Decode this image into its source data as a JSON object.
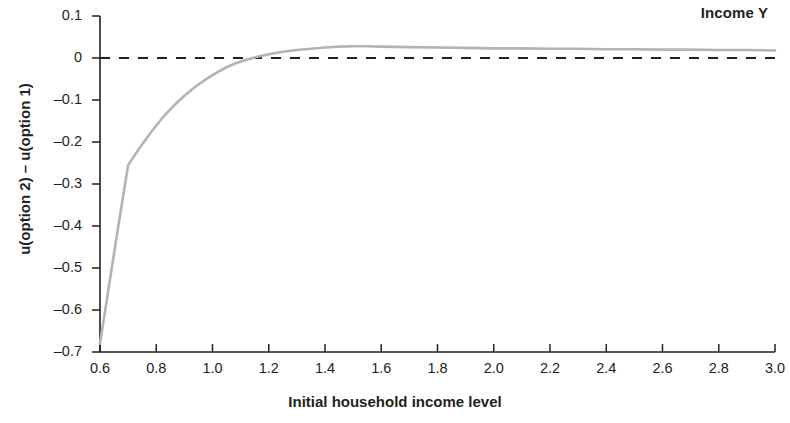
{
  "chart_data": {
    "type": "line",
    "title": "",
    "annotation": "Income Y",
    "xlabel": "Initial household income level",
    "ylabel": "u(option 2) – u(option 1)",
    "xlim": [
      0.6,
      3.0
    ],
    "ylim": [
      -0.7,
      0.1
    ],
    "xticks": [
      "0.6",
      "0.8",
      "1.0",
      "1.2",
      "1.4",
      "1.6",
      "1.8",
      "2.0",
      "2.2",
      "2.4",
      "2.6",
      "2.8",
      "3.0"
    ],
    "yticks": [
      "0.1",
      "0",
      "–0.1",
      "–0.2",
      "–0.3",
      "–0.4",
      "–0.5",
      "–0.6",
      "–0.7"
    ],
    "grid": false,
    "legend": "none",
    "reference_line": {
      "orientation": "horizontal",
      "value": 0,
      "style": "dashed",
      "color": "#231f20"
    },
    "series": [
      {
        "name": "u(option 2) - u(option 1)",
        "color": "#b3b3b3",
        "x": [
          0.6,
          0.62,
          0.64,
          0.66,
          0.68,
          0.7,
          0.74,
          0.78,
          0.82,
          0.86,
          0.9,
          0.94,
          0.98,
          1.0,
          1.02,
          1.05,
          1.08,
          1.12,
          1.16,
          1.2,
          1.25,
          1.3,
          1.35,
          1.4,
          1.45,
          1.5,
          1.55,
          1.6,
          1.7,
          1.8,
          1.9,
          2.0,
          2.1,
          2.2,
          2.3,
          2.4,
          2.5,
          2.6,
          2.7,
          2.8,
          2.9,
          3.0
        ],
        "y": [
          -0.68,
          -0.594,
          -0.508,
          -0.422,
          -0.338,
          -0.255,
          -0.215,
          -0.178,
          -0.144,
          -0.115,
          -0.09,
          -0.068,
          -0.049,
          -0.041,
          -0.033,
          -0.022,
          -0.013,
          -0.004,
          0.003,
          0.009,
          0.015,
          0.019,
          0.022,
          0.025,
          0.027,
          0.028,
          0.028,
          0.027,
          0.026,
          0.025,
          0.024,
          0.023,
          0.023,
          0.022,
          0.022,
          0.021,
          0.021,
          0.02,
          0.02,
          0.019,
          0.019,
          0.018
        ]
      }
    ]
  },
  "axes": {
    "y_tick_labels": [
      "0.1",
      "0",
      "–0.1",
      "–0.2",
      "–0.3",
      "–0.4",
      "–0.5",
      "–0.6",
      "–0.7"
    ],
    "x_tick_labels": [
      "0.6",
      "0.8",
      "1.0",
      "1.2",
      "1.4",
      "1.6",
      "1.8",
      "2.0",
      "2.2",
      "2.4",
      "2.6",
      "2.8",
      "3.0"
    ],
    "x_title": "Initial household income level",
    "y_title": "u(option 2) – u(option 1)"
  },
  "annotation": {
    "label": "Income Y"
  },
  "colors": {
    "curve": "#b3b3b3",
    "axis": "#231f20",
    "text": "#231f20",
    "background": "#ffffff"
  }
}
